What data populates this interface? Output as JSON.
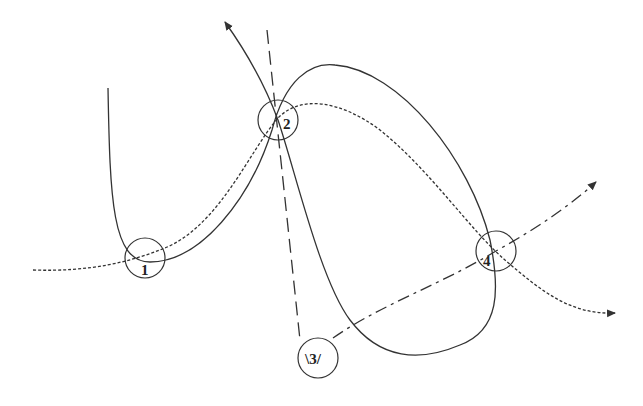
{
  "diagram": {
    "nodes": [
      {
        "id": "1",
        "label": "1",
        "cx": 145,
        "cy": 258,
        "r": 20
      },
      {
        "id": "2",
        "label": "2",
        "cx": 278,
        "cy": 120,
        "r": 20
      },
      {
        "id": "3",
        "label": "\\3/",
        "cx": 318,
        "cy": 358,
        "r": 20
      },
      {
        "id": "4",
        "label": "4",
        "cx": 496,
        "cy": 251,
        "r": 20
      }
    ],
    "curves": [
      {
        "name": "solid-loop-curve",
        "style": "solid",
        "arrow_end": true
      },
      {
        "name": "dotted-curve",
        "style": "dotted",
        "arrow_end": true
      },
      {
        "name": "long-dash-line",
        "style": "long-dash",
        "arrow_end": false
      },
      {
        "name": "dash-dot-curve",
        "style": "dash-dot",
        "arrow_end": true
      }
    ],
    "colors": {
      "stroke": "#333333",
      "background": "#ffffff"
    }
  }
}
